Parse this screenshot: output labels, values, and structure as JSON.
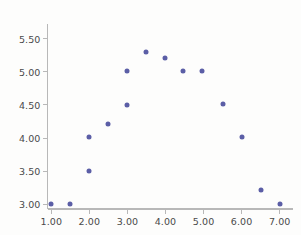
{
  "chart_data": {
    "type": "scatter",
    "title": "",
    "xlabel": "",
    "ylabel": "",
    "xlim": [
      0.9,
      7.35
    ],
    "ylim": [
      2.93,
      5.72
    ],
    "grid": false,
    "legend": null,
    "marker_color": "#5b5ea6",
    "background_color": "#fdfdfc",
    "axis_color": "#b8b8b8",
    "tick_label_color": "#4a4a4a",
    "x_ticks": [
      1.0,
      2.0,
      3.0,
      4.0,
      5.0,
      6.0,
      7.0
    ],
    "x_tick_labels": [
      "1.00",
      "2.00",
      "3.00",
      "4.00",
      "5.00",
      "6.00",
      "7.00"
    ],
    "y_ticks": [
      3.0,
      3.5,
      4.0,
      4.5,
      5.0,
      5.5
    ],
    "y_tick_labels": [
      "3.00",
      "3.50",
      "4.00",
      "4.50",
      "5.00",
      "5.50"
    ],
    "points": [
      {
        "x": 1.0,
        "y": 3.0
      },
      {
        "x": 1.5,
        "y": 3.0
      },
      {
        "x": 2.0,
        "y": 3.5
      },
      {
        "x": 2.0,
        "y": 4.01
      },
      {
        "x": 2.5,
        "y": 4.21
      },
      {
        "x": 3.0,
        "y": 4.5
      },
      {
        "x": 3.0,
        "y": 5.01
      },
      {
        "x": 3.5,
        "y": 5.3
      },
      {
        "x": 4.0,
        "y": 5.2
      },
      {
        "x": 4.45,
        "y": 5.01
      },
      {
        "x": 4.95,
        "y": 5.01
      },
      {
        "x": 5.5,
        "y": 4.52
      },
      {
        "x": 6.0,
        "y": 4.01
      },
      {
        "x": 6.5,
        "y": 3.22
      },
      {
        "x": 7.0,
        "y": 3.0
      }
    ]
  }
}
